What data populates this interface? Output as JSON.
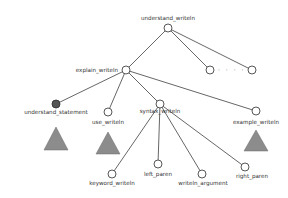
{
  "diagram": {
    "type": "tree",
    "nodes": {
      "root": {
        "label": "understand_writeln",
        "x": 168,
        "y": 28,
        "filled": false
      },
      "explain": {
        "label": "explain_writeln",
        "x": 126,
        "y": 70,
        "filled": false
      },
      "sibling1": {
        "label": "",
        "x": 210,
        "y": 70,
        "filled": false
      },
      "sibling2": {
        "label": "",
        "x": 252,
        "y": 70,
        "filled": false
      },
      "understand_statement": {
        "label": "understand_statement",
        "x": 56,
        "y": 104,
        "filled": true
      },
      "use": {
        "label": "use_writeln",
        "x": 108,
        "y": 112,
        "filled": false
      },
      "syntax": {
        "label": "syntax_writeln",
        "x": 160,
        "y": 104,
        "filled": false
      },
      "example": {
        "label": "example_writeln",
        "x": 256,
        "y": 111,
        "filled": false
      },
      "keyword": {
        "label": "keyword_writeln",
        "x": 112,
        "y": 174,
        "filled": false
      },
      "left_paren": {
        "label": "left_paren",
        "x": 158,
        "y": 164,
        "filled": false
      },
      "writeln_argument": {
        "label": "writeln_argument",
        "x": 202,
        "y": 174,
        "filled": false
      },
      "right_paren": {
        "label": "right_paren",
        "x": 245,
        "y": 167,
        "filled": false
      }
    },
    "ellipsis": "· · · ·",
    "edges": [
      [
        "root",
        "explain"
      ],
      [
        "root",
        "sibling1"
      ],
      [
        "root",
        "sibling2"
      ],
      [
        "explain",
        "understand_statement"
      ],
      [
        "explain",
        "use"
      ],
      [
        "explain",
        "syntax"
      ],
      [
        "explain",
        "example"
      ],
      [
        "syntax",
        "keyword"
      ],
      [
        "syntax",
        "left_paren"
      ],
      [
        "syntax",
        "writeln_argument"
      ],
      [
        "syntax",
        "right_paren"
      ]
    ],
    "collapsed_subtrees": [
      "understand_statement",
      "use",
      "example"
    ],
    "colors": {
      "edge": "#555555",
      "node_stroke": "#444444",
      "node_filled": "#555555",
      "triangle": "#8c8c8c",
      "label": "#333333"
    }
  }
}
